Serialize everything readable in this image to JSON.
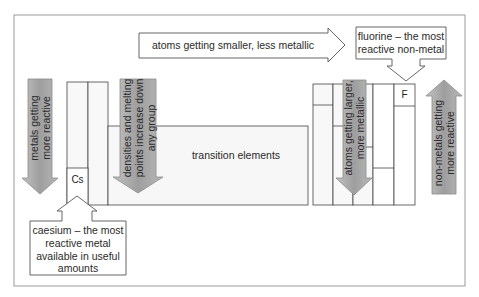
{
  "diagram": {
    "top_arrow": {
      "label": "atoms getting smaller, less metallic",
      "direction": "right"
    },
    "fluorine_callout": {
      "lines": [
        "fluorine – the most",
        "reactive non-metal"
      ]
    },
    "caesium_callout": {
      "lines": [
        "caesium – the most",
        "reactive metal",
        "available in useful",
        "amounts"
      ]
    },
    "left_arrow": {
      "lines": [
        "metals getting",
        "more reactive"
      ],
      "direction": "down"
    },
    "density_arrow": {
      "lines": [
        "densities and melting",
        "points increase down",
        "any group"
      ],
      "direction": "down"
    },
    "atoms_larger_arrow": {
      "lines": [
        "atoms getting larger,",
        "more metallic"
      ],
      "direction": "down"
    },
    "nonmetal_arrow": {
      "lines": [
        "non-metals getting",
        "more reactive"
      ],
      "direction": "up"
    },
    "transition_label": "transition elements",
    "element_cs": "Cs",
    "element_f": "F",
    "colors": {
      "arrow_fill": "#a9a9a9",
      "arrow_stroke": "#8a8a8a",
      "outline": "#555555",
      "frame": "#9a9a9a",
      "block_fill": "#f7f7f7"
    }
  }
}
